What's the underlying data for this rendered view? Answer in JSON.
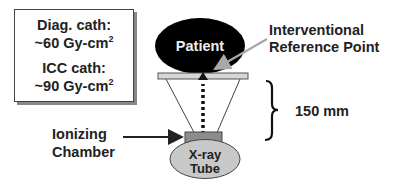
{
  "dose_box": {
    "diag_label": "Diag. cath:",
    "diag_value": "~60 Gy-cm",
    "diag_exp": "2",
    "icc_label": "ICC cath:",
    "icc_value": "~90 Gy-cm",
    "icc_exp": "2"
  },
  "diagram": {
    "patient_label": "Patient",
    "irp_label_line1": "Interventional",
    "irp_label_line2": "Reference Point",
    "distance_label": "150 mm",
    "chamber_label_line1": "Ionizing",
    "chamber_label_line2": "Chamber",
    "tube_label_line1": "X-ray",
    "tube_label_line2": "Tube"
  },
  "colors": {
    "patient_fill": "#000000",
    "table_fill": "#d6d6d6",
    "chamber_fill": "#8c8c8c",
    "tube_fill": "#c8c8c8",
    "irp_arrow": "#a8a8a8",
    "text": "#222222"
  }
}
